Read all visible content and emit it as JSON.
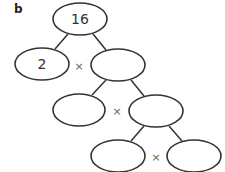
{
  "part_label": "b",
  "tree": {
    "nodes": [
      {
        "id": "root",
        "value": "16"
      },
      {
        "id": "l1-left",
        "value": "2"
      },
      {
        "id": "l1-right",
        "value": ""
      },
      {
        "id": "l2-left",
        "value": ""
      },
      {
        "id": "l2-right",
        "value": ""
      },
      {
        "id": "l3-left",
        "value": ""
      },
      {
        "id": "l3-right",
        "value": ""
      }
    ],
    "edges": [
      [
        "root",
        "l1-left"
      ],
      [
        "root",
        "l1-right"
      ],
      [
        "l1-right",
        "l2-left"
      ],
      [
        "l1-right",
        "l2-right"
      ],
      [
        "l2-right",
        "l3-left"
      ],
      [
        "l2-right",
        "l3-right"
      ]
    ],
    "operator": "×"
  }
}
